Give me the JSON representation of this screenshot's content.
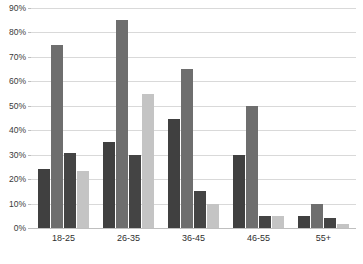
{
  "chart_data": {
    "type": "bar",
    "title": "",
    "subtitle": "",
    "xlabel": "",
    "ylabel": "",
    "categories": [
      "18-25",
      "26-35",
      "36-45",
      "46-55",
      "55+"
    ],
    "series": [
      {
        "name": "Series 1",
        "color": "#404040",
        "values": [
          24,
          35,
          44.5,
          30,
          5
        ]
      },
      {
        "name": "Series 2",
        "color": "#6e6e6e",
        "values": [
          75,
          85,
          65,
          50,
          10
        ]
      },
      {
        "name": "Series 3",
        "color": "#444444",
        "values": [
          30.5,
          30,
          15,
          5,
          4
        ]
      },
      {
        "name": "Series 4",
        "color": "#c4c4c4",
        "values": [
          23.5,
          55,
          10,
          5,
          1.5
        ]
      }
    ],
    "ylim": [
      0,
      90
    ],
    "ytick_values": [
      0,
      10,
      20,
      30,
      40,
      50,
      60,
      70,
      80,
      90
    ],
    "ytick_labels": [
      "0%",
      "10%",
      "20%",
      "30%",
      "40%",
      "50%",
      "60%",
      "70%",
      "80%",
      "90%"
    ],
    "grid": true,
    "grid_axis": "y",
    "grid_color": "#d9d9d9",
    "legend": false,
    "legend_position": "none",
    "background_color": "#ffffff",
    "axis_color": "#bfbfbf",
    "annotations": []
  }
}
